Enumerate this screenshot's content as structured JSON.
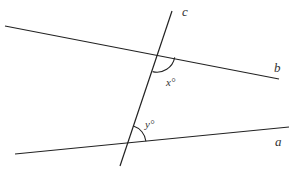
{
  "diagram": {
    "type": "geometry-parallel-lines-transversal",
    "colors": {
      "line": "#222222",
      "text": "#333333",
      "background": "#ffffff"
    },
    "lines": [
      {
        "id": "a",
        "label": "a",
        "x1": 15,
        "y1": 154,
        "x2": 289,
        "y2": 127
      },
      {
        "id": "b",
        "label": "b",
        "x1": 5,
        "y1": 26,
        "x2": 279,
        "y2": 79
      },
      {
        "id": "c",
        "label": "c",
        "x1": 172,
        "y1": 11,
        "x2": 120,
        "y2": 166
      }
    ],
    "line_labels": {
      "a": "a",
      "b": "b",
      "c": "c"
    },
    "angles": {
      "x": {
        "label": "x°",
        "vertex": [
          157,
          54
        ]
      },
      "y": {
        "label": "y°",
        "vertex": [
          128,
          143
        ]
      }
    }
  }
}
